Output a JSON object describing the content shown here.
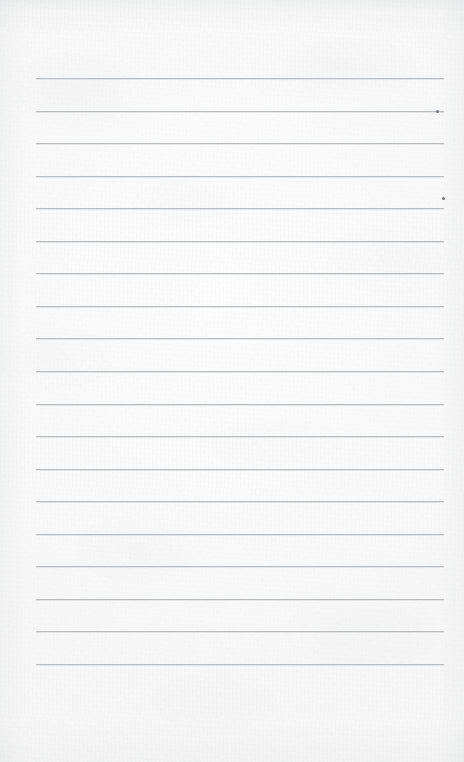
{
  "page": {
    "kind": "ruled-notebook-paper",
    "width": 464,
    "height": 762,
    "paper_color": "#fbfbfb",
    "rule_color": "#b9bdc0",
    "speck_color": "#6e7276",
    "content_text": ""
  },
  "ruling": {
    "line_count": 19,
    "first_line_y": 78,
    "line_spacing": 32.6,
    "line_left_x": 36,
    "line_right_x": 444,
    "line_thickness": 1,
    "top_margin": 78,
    "bottom_margin": 98,
    "left_margin": 36,
    "right_margin": 20,
    "lines": [
      {
        "index": 1,
        "y": 78,
        "x1": 36,
        "x2": 444
      },
      {
        "index": 2,
        "y": 111,
        "x1": 36,
        "x2": 444
      },
      {
        "index": 3,
        "y": 143,
        "x1": 36,
        "x2": 444
      },
      {
        "index": 4,
        "y": 176,
        "x1": 36,
        "x2": 444
      },
      {
        "index": 5,
        "y": 208,
        "x1": 36,
        "x2": 444
      },
      {
        "index": 6,
        "y": 241,
        "x1": 36,
        "x2": 444
      },
      {
        "index": 7,
        "y": 273,
        "x1": 36,
        "x2": 444
      },
      {
        "index": 8,
        "y": 306,
        "x1": 36,
        "x2": 444
      },
      {
        "index": 9,
        "y": 338,
        "x1": 36,
        "x2": 444
      },
      {
        "index": 10,
        "y": 371,
        "x1": 36,
        "x2": 444
      },
      {
        "index": 11,
        "y": 404,
        "x1": 36,
        "x2": 444
      },
      {
        "index": 12,
        "y": 436,
        "x1": 36,
        "x2": 444
      },
      {
        "index": 13,
        "y": 469,
        "x1": 36,
        "x2": 444
      },
      {
        "index": 14,
        "y": 501,
        "x1": 36,
        "x2": 444
      },
      {
        "index": 15,
        "y": 534,
        "x1": 36,
        "x2": 444
      },
      {
        "index": 16,
        "y": 566,
        "x1": 36,
        "x2": 444
      },
      {
        "index": 17,
        "y": 599,
        "x1": 36,
        "x2": 444
      },
      {
        "index": 18,
        "y": 631,
        "x1": 36,
        "x2": 444
      },
      {
        "index": 19,
        "y": 664,
        "x1": 36,
        "x2": 444
      }
    ]
  },
  "marks": [
    {
      "name": "speck-on-line-2",
      "x": 436,
      "y": 110,
      "w": 3,
      "h": 3
    },
    {
      "name": "speck-above-line-5",
      "x": 442,
      "y": 197,
      "w": 3,
      "h": 3
    }
  ]
}
